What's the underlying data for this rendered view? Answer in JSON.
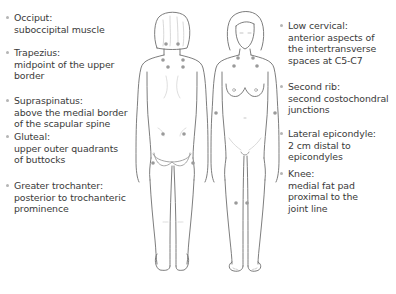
{
  "figure": {
    "colors": {
      "text": "#3a3a3a",
      "outline": "#6e6e6e",
      "tender_point": "#9a9a9a",
      "bullet": "#b5b5b5"
    },
    "left_labels": [
      {
        "title": "Occiput:",
        "desc": [
          "suboccipital muscle"
        ]
      },
      {
        "title": "Trapezius:",
        "desc": [
          "midpoint of the upper",
          "border"
        ]
      },
      {
        "title": "Supraspinatus:",
        "desc": [
          "above the medial border",
          "of the scapular spine"
        ]
      },
      {
        "title": "Gluteal:",
        "desc": [
          "upper outer quadrants",
          "of buttocks"
        ]
      },
      {
        "title": "Greater trochanter:",
        "desc": [
          "posterior to trochanteric",
          "prominence"
        ]
      }
    ],
    "right_labels": [
      {
        "title": "Low cervical:",
        "desc": [
          "anterior aspects of",
          "the intertransverse",
          "spaces at C5-C7"
        ]
      },
      {
        "title": "Second rib:",
        "desc": [
          "second costochondral",
          "junctions"
        ]
      },
      {
        "title": "Lateral epicondyle:",
        "desc": [
          "2 cm distal to",
          "epicondyles"
        ]
      },
      {
        "title": "Knee:",
        "desc": [
          "medial fat pad",
          "proximal to the",
          "joint line"
        ]
      }
    ]
  }
}
